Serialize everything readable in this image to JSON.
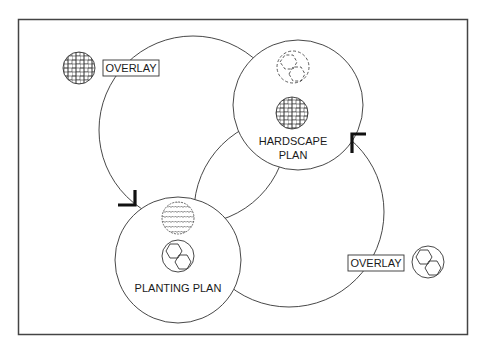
{
  "diagram": {
    "colors": {
      "stroke": "#333333",
      "frame": "#444444",
      "background": "#ffffff",
      "text": "#1a1a1a"
    },
    "nodes": {
      "hardscape": {
        "line1": "HARDSCAPE",
        "line2": "PLAN",
        "icons": [
          "dashed-hexagon-pair-icon",
          "brick-pattern-icon"
        ]
      },
      "planting": {
        "label": "PLANTING PLAN",
        "icons": [
          "wavy-pattern-icon",
          "hexagon-pair-icon"
        ]
      }
    },
    "overlays": [
      {
        "label": "OVERLAY",
        "icon": "brick-pattern-icon",
        "position": "top-left"
      },
      {
        "label": "OVERLAY",
        "icon": "hexagon-pair-icon",
        "position": "bottom-right"
      }
    ],
    "flows": [
      {
        "from": "hardscape",
        "to": "planting",
        "via": "overlay-top-left"
      },
      {
        "from": "planting",
        "to": "hardscape",
        "via": "overlay-bottom-right"
      }
    ]
  }
}
